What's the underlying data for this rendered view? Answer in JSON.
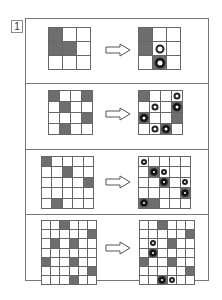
{
  "problem_number": "1",
  "colors": {
    "filled": "#6e6e6e",
    "line": "#666666",
    "frame": "#777777"
  },
  "arrow_icon": "outline-right-arrow",
  "panels": [
    {
      "rows": 3,
      "cols": 3,
      "before": {
        "filled": [
          [
            0,
            0
          ],
          [
            1,
            0
          ],
          [
            1,
            1
          ]
        ]
      },
      "after": {
        "filled": [
          [
            0,
            0
          ],
          [
            1,
            0
          ],
          [
            2,
            1
          ]
        ],
        "marks": [
          {
            "r": 1,
            "c": 1,
            "type": "white"
          },
          {
            "r": 2,
            "c": 1,
            "type": "dark"
          }
        ]
      }
    },
    {
      "rows": 4,
      "cols": 4,
      "before": {
        "filled": [
          [
            0,
            0
          ],
          [
            0,
            3
          ],
          [
            1,
            1
          ],
          [
            2,
            3
          ],
          [
            3,
            1
          ]
        ]
      },
      "after": {
        "filled": [
          [
            0,
            0
          ],
          [
            1,
            3
          ],
          [
            2,
            0
          ],
          [
            2,
            3
          ],
          [
            3,
            2
          ]
        ],
        "marks": [
          {
            "r": 0,
            "c": 3,
            "type": "white"
          },
          {
            "r": 1,
            "c": 1,
            "type": "white"
          },
          {
            "r": 1,
            "c": 3,
            "type": "dark"
          },
          {
            "r": 2,
            "c": 0,
            "type": "dark"
          },
          {
            "r": 3,
            "c": 1,
            "type": "white"
          },
          {
            "r": 3,
            "c": 2,
            "type": "dark"
          }
        ]
      }
    },
    {
      "rows": 5,
      "cols": 5,
      "before": {
        "filled": [
          [
            0,
            0
          ],
          [
            1,
            2
          ],
          [
            2,
            4
          ],
          [
            4,
            1
          ]
        ]
      },
      "after": {
        "filled": [
          [
            1,
            1
          ],
          [
            2,
            2
          ],
          [
            3,
            4
          ],
          [
            4,
            0
          ],
          [
            4,
            1
          ]
        ],
        "marks": [
          {
            "r": 0,
            "c": 0,
            "type": "white"
          },
          {
            "r": 1,
            "c": 1,
            "type": "dark"
          },
          {
            "r": 1,
            "c": 2,
            "type": "white"
          },
          {
            "r": 2,
            "c": 2,
            "type": "dark"
          },
          {
            "r": 2,
            "c": 4,
            "type": "white"
          },
          {
            "r": 3,
            "c": 4,
            "type": "dark"
          },
          {
            "r": 4,
            "c": 0,
            "type": "dark"
          }
        ]
      }
    },
    {
      "rows": 7,
      "cols": 6,
      "before": {
        "filled": [
          [
            0,
            2
          ],
          [
            1,
            5
          ],
          [
            2,
            1
          ],
          [
            2,
            3
          ],
          [
            4,
            0
          ],
          [
            4,
            3
          ],
          [
            5,
            5
          ],
          [
            6,
            3
          ]
        ]
      },
      "after": {
        "filled": [
          [
            0,
            2
          ],
          [
            1,
            5
          ],
          [
            2,
            3
          ],
          [
            3,
            1
          ],
          [
            4,
            0
          ],
          [
            4,
            3
          ],
          [
            5,
            5
          ],
          [
            6,
            2
          ]
        ],
        "marks": [
          {
            "r": 2,
            "c": 1,
            "type": "white"
          },
          {
            "r": 3,
            "c": 1,
            "type": "dark"
          },
          {
            "r": 6,
            "c": 2,
            "type": "dark"
          },
          {
            "r": 6,
            "c": 3,
            "type": "white"
          }
        ]
      }
    }
  ]
}
